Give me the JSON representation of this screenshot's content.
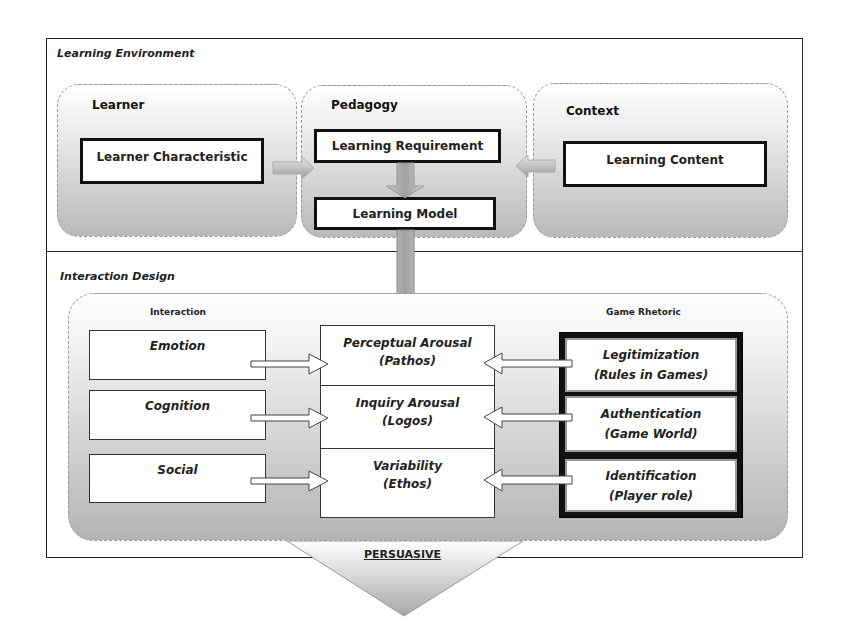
{
  "diagram": {
    "sections": {
      "learning_environment": {
        "label": "Learning Environment",
        "groups": {
          "learner": {
            "label": "Learner",
            "box": "Learner Characteristic"
          },
          "pedagogy": {
            "label": "Pedagogy",
            "requirement": "Learning Requirement",
            "model": "Learning Model"
          },
          "context": {
            "label": "Context",
            "box": "Learning Content"
          }
        }
      },
      "interaction_design": {
        "label": "Interaction Design",
        "interaction": {
          "label": "Interaction",
          "items": [
            "Emotion",
            "Cognition",
            "Social"
          ]
        },
        "center": [
          {
            "title": "Perceptual Arousal",
            "subtitle": "(Pathos)"
          },
          {
            "title": "Inquiry Arousal",
            "subtitle": "(Logos)"
          },
          {
            "title": "Variability",
            "subtitle": "(Ethos)"
          }
        ],
        "game_rhetoric": {
          "label": "Game Rhetoric",
          "items": [
            {
              "title": "Legitimization",
              "subtitle": "(Rules in Games)"
            },
            {
              "title": "Authentication",
              "subtitle": "(Game World)"
            },
            {
              "title": "Identification",
              "subtitle": "(Player role)"
            }
          ]
        }
      }
    },
    "output": {
      "label": "PERSUASIVE"
    },
    "colors": {
      "border": "#222222",
      "group_gradient_top": "#ffffff",
      "group_gradient_bottom": "#b9b9b9",
      "dashed": "#9a9a9a"
    }
  }
}
